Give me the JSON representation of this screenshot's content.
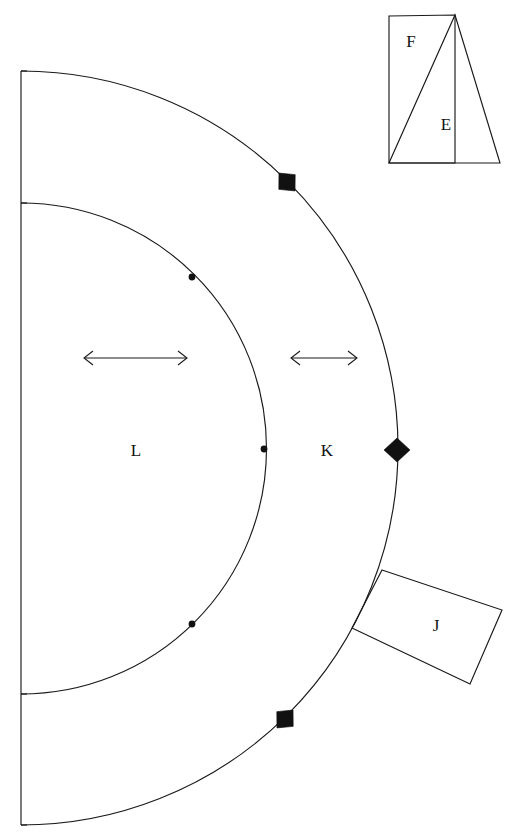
{
  "figure": {
    "type": "technical-line-drawing",
    "background_color": "#ffffff",
    "stroke_color": "#1a1a1a",
    "fill_color": "#111111",
    "width": 520,
    "height": 838
  },
  "labels": {
    "inner_band": "L",
    "outer_band": "K",
    "attached_block": "J",
    "triangle": "E",
    "corner_region": "F"
  },
  "geometry": {
    "arc_center_x": 21,
    "arc_center_y": 448,
    "outer_radius": 376,
    "inner_radius": 243,
    "axis_line": {
      "x": 21,
      "y_top": 71,
      "y_bottom": 825
    },
    "outer_arc": {
      "start_x": 21,
      "start_y": 71,
      "end_x": 21,
      "end_y": 825
    },
    "inner_arc": {
      "start_x": 21,
      "start_y": 203,
      "end_x": 21,
      "end_y": 694
    }
  },
  "markers": {
    "outer_diamonds": [
      {
        "x": 287,
        "y": 182,
        "angle": -45
      },
      {
        "x": 397,
        "y": 450,
        "angle": 0
      },
      {
        "x": 285,
        "y": 719,
        "angle": 45
      }
    ],
    "inner_dots": [
      {
        "x": 192,
        "y": 277
      },
      {
        "x": 264,
        "y": 449
      },
      {
        "x": 192,
        "y": 624
      }
    ]
  },
  "dimension_arrows": [
    {
      "name": "inner-band-width",
      "x1": 84,
      "x2": 187,
      "y": 358
    },
    {
      "name": "outer-band-width",
      "x1": 291,
      "x2": 357,
      "y": 358
    }
  ],
  "shapes": {
    "block_j": {
      "points": "382,570 502,610 470,684 352,628",
      "label_x": 436,
      "label_y": 627
    },
    "panel_f": {
      "points": "389,16 455,15 455,163 389,163",
      "label_x": 411,
      "label_y": 43
    },
    "triangle_e": {
      "points": "455,15 500,163 389,163",
      "label_x": 446,
      "label_y": 126
    }
  }
}
